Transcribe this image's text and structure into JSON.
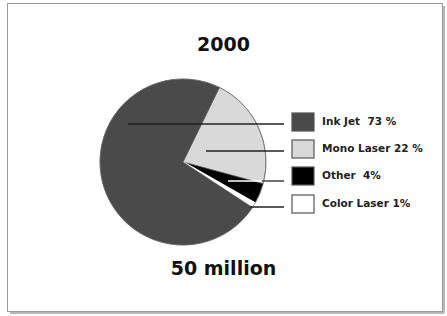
{
  "chart_data": {
    "type": "pie",
    "title": "2000",
    "subtitle": "50 million",
    "categories": [
      "Ink Jet",
      "Mono Laser",
      "Other",
      "Color Laser"
    ],
    "values": [
      73,
      22,
      4,
      1
    ],
    "unit": "%",
    "colors": [
      "#4a4a4a",
      "#d9d9d9",
      "#000000",
      "#ffffff"
    ],
    "legend": {
      "position": "right",
      "entries": [
        {
          "label": "Ink Jet  73 %",
          "color": "#4a4a4a"
        },
        {
          "label": "Mono Laser 22 %",
          "color": "#d9d9d9"
        },
        {
          "label": "Other  4%",
          "color": "#000000"
        },
        {
          "label": "Color Laser 1%",
          "color": "#ffffff"
        }
      ]
    },
    "leader_lines": true
  }
}
